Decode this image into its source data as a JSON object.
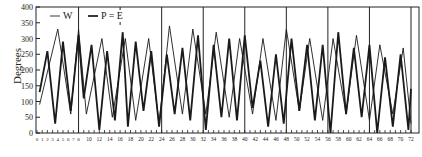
{
  "chart_data": {
    "type": "line",
    "title": "",
    "xlabel": "",
    "ylabel": "Degrees",
    "xlim": [
      0,
      72
    ],
    "ylim": [
      0,
      400
    ],
    "yticks": [
      0,
      50,
      100,
      150,
      200,
      250,
      300,
      350,
      400
    ],
    "xticks_labeled": [
      0,
      1,
      2,
      3,
      4,
      5,
      6,
      7,
      8,
      10,
      12,
      14,
      16,
      18,
      20,
      22,
      24,
      26,
      28,
      30,
      32,
      34,
      36,
      38,
      40,
      42,
      44,
      46,
      48,
      50,
      52,
      54,
      56,
      58,
      60,
      62,
      64,
      66,
      68,
      70,
      72
    ],
    "minor_tick_step": 1,
    "vertical_dividers": [
      8,
      24,
      32,
      40,
      48,
      56,
      64,
      72
    ],
    "short_top_marks": [
      16
    ],
    "grid": false,
    "legend": {
      "position": "top-left inside",
      "entries": [
        {
          "label": "W",
          "style": "thin"
        },
        {
          "label": "P = E",
          "style": "thick"
        }
      ]
    },
    "series": [
      {
        "name": "W",
        "style": "thin",
        "x": [
          0.5,
          4,
          6.5,
          8,
          9.5,
          12.5,
          14.5,
          17,
          19,
          21.5,
          23.5,
          25.5,
          28,
          30,
          32.5,
          34.5,
          37,
          39,
          41.5,
          43.5,
          46,
          48,
          50.5,
          52.5,
          55,
          57,
          59.5,
          61.5,
          64,
          66,
          68.5,
          70.5,
          72
        ],
        "y": [
          90,
          330,
          60,
          330,
          60,
          300,
          50,
          300,
          40,
          300,
          30,
          340,
          60,
          330,
          60,
          320,
          50,
          300,
          60,
          300,
          40,
          330,
          70,
          300,
          40,
          300,
          60,
          310,
          40,
          280,
          60,
          270,
          30
        ]
      },
      {
        "name": "P = E",
        "style": "thick",
        "x": [
          0.5,
          2,
          3.5,
          5,
          6.5,
          8,
          9,
          10.5,
          12,
          13.5,
          15,
          16.5,
          17.5,
          19,
          20.5,
          22,
          23.5,
          25,
          26.5,
          28,
          29.5,
          31,
          32.5,
          34,
          35.5,
          37,
          38.5,
          40,
          41.5,
          43,
          44.5,
          46,
          47.5,
          49,
          50.5,
          52,
          53.5,
          55,
          56.5,
          58,
          59.5,
          61,
          62.5,
          64,
          65.5,
          67,
          68.5,
          70,
          71.5,
          72
        ],
        "y": [
          130,
          260,
          30,
          290,
          70,
          310,
          110,
          280,
          10,
          260,
          40,
          320,
          20,
          290,
          70,
          260,
          20,
          250,
          60,
          270,
          40,
          310,
          10,
          280,
          50,
          300,
          40,
          310,
          80,
          230,
          20,
          250,
          30,
          300,
          70,
          280,
          40,
          280,
          0,
          320,
          60,
          270,
          50,
          280,
          0,
          240,
          20,
          250,
          10,
          140
        ]
      }
    ]
  },
  "labels": {
    "ylabel": "Degrees",
    "legend_w": "W",
    "legend_pe": "P = E"
  }
}
